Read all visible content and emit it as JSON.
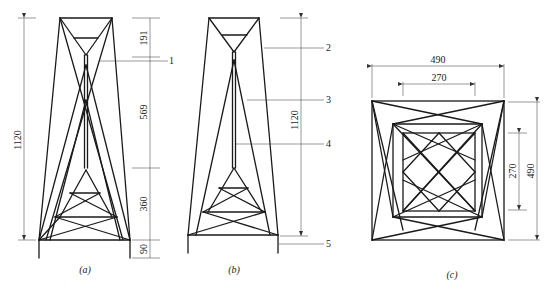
{
  "figure": {
    "panels": [
      {
        "id": "a",
        "caption": "(a)"
      },
      {
        "id": "b",
        "caption": "(b)"
      },
      {
        "id": "c",
        "caption": "(c)"
      }
    ],
    "panel_a": {
      "overall_height": "1120",
      "segments": [
        "191",
        "569",
        "360",
        "90"
      ],
      "callout": "1"
    },
    "panel_b": {
      "overall_height": "1120",
      "callouts": [
        "2",
        "3",
        "4",
        "5"
      ]
    },
    "panel_c": {
      "outer_width": "490",
      "inner_width": "270",
      "inner_height": "270",
      "outer_height": "490"
    }
  }
}
